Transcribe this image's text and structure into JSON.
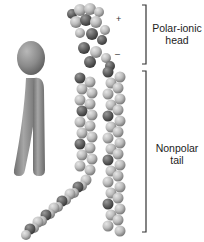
{
  "figure": {
    "labels": {
      "head_line1": "Polar-ionic",
      "head_line2": "head",
      "tail_line1": "Nonpolar",
      "tail_line2": "tail"
    },
    "charges": {
      "positive": "+",
      "negative": "–"
    },
    "brackets": {
      "head": {
        "x": 146,
        "y_top": 5,
        "y_bottom": 64
      },
      "tail": {
        "x": 146,
        "y_top": 71,
        "y_bottom": 232
      }
    },
    "colors": {
      "background": "#ffffff",
      "schematic": "#8a8a8a",
      "atom_light": "#c8c8c8",
      "atom_dark": "#5a5a5a",
      "bracket": "#333333"
    }
  }
}
